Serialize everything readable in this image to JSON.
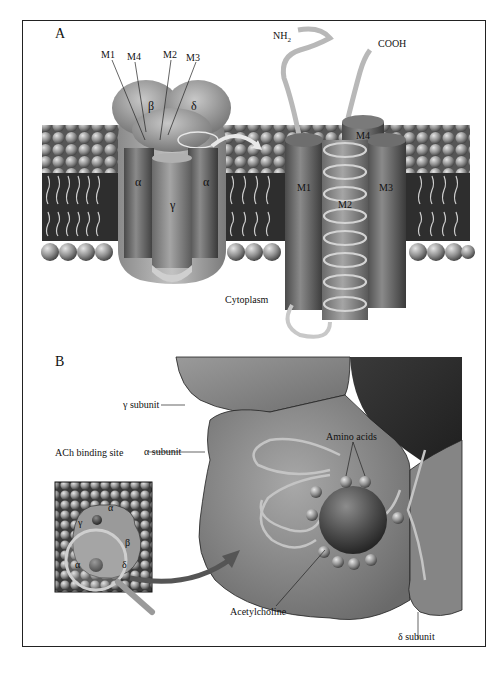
{
  "figure": {
    "panels": [
      {
        "id": "A",
        "label": "A",
        "left_structure": {
          "subunits": {
            "beta": "β",
            "delta": "δ",
            "alpha_left": "α",
            "gamma": "γ",
            "alpha_right": "α"
          },
          "segment_labels": [
            "M1",
            "M4",
            "M2",
            "M3"
          ]
        },
        "right_structure": {
          "terminals": {
            "n_terminal": "NH",
            "n_sub": "2",
            "c_terminal": "COOH"
          },
          "helices": {
            "m1": "M1",
            "m2": "M2",
            "m3": "M3",
            "m4": "M4"
          }
        },
        "region_label": "Cytoplasm"
      },
      {
        "id": "B",
        "label": "B",
        "callouts": {
          "gamma_subunit": "γ subunit",
          "alpha_subunit": "α subunit",
          "ach_binding_site": "ACh binding site",
          "amino_acids": "Amino acids",
          "acetylcholine": "Acetylcholine",
          "delta_subunit": "δ subunit"
        },
        "inset_subunits": {
          "alpha_top": "α",
          "gamma": "γ",
          "beta": "β",
          "alpha_bottom": "α",
          "delta": "δ"
        }
      }
    ],
    "colors": {
      "frame": "#222222",
      "membrane_dark": "#2e2e2e",
      "protein_mid": "#8a8a8a",
      "protein_light": "#b5b5b5",
      "protein_dark": "#555555",
      "ribbon": "#c8c8c8"
    }
  }
}
